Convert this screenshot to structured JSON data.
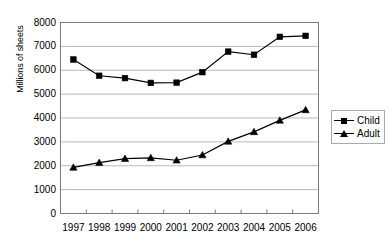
{
  "chart_data": {
    "type": "line",
    "title": "",
    "xlabel": "",
    "ylabel": "Millions of sheets",
    "categories": [
      "1997",
      "1998",
      "1999",
      "2000",
      "2001",
      "2002",
      "2003",
      "2004",
      "2005",
      "2006"
    ],
    "ylim": [
      0,
      8000
    ],
    "ytick_labels": [
      "8000",
      "7000",
      "6000",
      "5000",
      "4000",
      "3000",
      "2000",
      "1000",
      "0"
    ],
    "ytick_values": [
      8000,
      7000,
      6000,
      5000,
      4000,
      3000,
      2000,
      1000,
      0
    ],
    "grid": "horizontal",
    "legend_position": "right",
    "series": [
      {
        "name": "Child",
        "marker": "square",
        "color": "#000000",
        "values": [
          6450,
          5770,
          5670,
          5470,
          5480,
          5920,
          6780,
          6650,
          7400,
          7440
        ]
      },
      {
        "name": "Adult",
        "marker": "triangle",
        "color": "#000000",
        "values": [
          1930,
          2130,
          2300,
          2330,
          2230,
          2450,
          3020,
          3420,
          3900,
          4340
        ]
      }
    ]
  },
  "legend": {
    "items": [
      {
        "label": "Child"
      },
      {
        "label": "Adult"
      }
    ]
  },
  "axes": {
    "y_title": "Millions of sheets"
  }
}
